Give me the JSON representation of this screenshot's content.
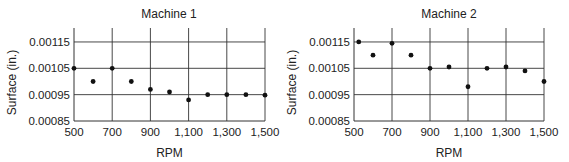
{
  "chart_data": [
    {
      "type": "scatter",
      "title": "Machine 1",
      "xlabel": "RPM",
      "ylabel": "Surface (in.)",
      "xlim": [
        500,
        1500
      ],
      "ylim": [
        0.00085,
        0.0012
      ],
      "x_ticks": [
        500,
        700,
        900,
        1100,
        1300,
        1500
      ],
      "x_tick_labels": [
        "500",
        "700",
        "900",
        "1,100",
        "1,300",
        "1,500"
      ],
      "y_ticks": [
        0.00085,
        0.00095,
        0.00105,
        0.00115
      ],
      "y_tick_labels": [
        "0.00085",
        "0.00095",
        "0.00105",
        "0.00115"
      ],
      "grid": true,
      "legend": null,
      "x": [
        500,
        600,
        700,
        800,
        900,
        1000,
        1100,
        1200,
        1300,
        1400,
        1500
      ],
      "y": [
        0.00105,
        0.001,
        0.00105,
        0.001,
        0.00097,
        0.00096,
        0.00093,
        0.00095,
        0.00095,
        0.00095,
        0.000948
      ]
    },
    {
      "type": "scatter",
      "title": "Machine 2",
      "xlabel": "RPM",
      "ylabel": "Surface (in.)",
      "xlim": [
        500,
        1500
      ],
      "ylim": [
        0.00085,
        0.0012
      ],
      "x_ticks": [
        500,
        700,
        900,
        1100,
        1300,
        1500
      ],
      "x_tick_labels": [
        "500",
        "700",
        "900",
        "1,100",
        "1,300",
        "1,500"
      ],
      "y_ticks": [
        0.00085,
        0.00095,
        0.00105,
        0.00115
      ],
      "y_tick_labels": [
        "0.00085",
        "0.00095",
        "0.00105",
        "0.00115"
      ],
      "grid": true,
      "legend": null,
      "x": [
        525,
        600,
        700,
        800,
        900,
        1000,
        1100,
        1200,
        1300,
        1400,
        1500
      ],
      "y": [
        0.00115,
        0.0011,
        0.001145,
        0.0011,
        0.00105,
        0.001055,
        0.00098,
        0.00105,
        0.001055,
        0.00104,
        0.001
      ]
    }
  ]
}
